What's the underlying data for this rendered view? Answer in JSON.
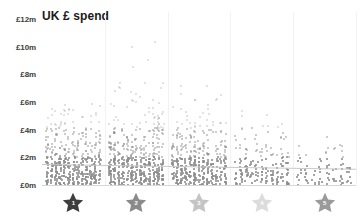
{
  "chart": {
    "title": "UK £ spend",
    "currency_symbol": "£"
  },
  "chart_data": {
    "type": "scatter",
    "title": "UK £ spend",
    "xlabel": "",
    "ylabel": "UK £ spend",
    "grid": "vertical-only",
    "legend": "none",
    "ylim": [
      0,
      12500000
    ],
    "ytick_labels": [
      "£12m",
      "£10m",
      "£8m",
      "£6m",
      "£4m",
      "£2m",
      "£0m"
    ],
    "ytick_values": [
      12000000,
      10000000,
      8000000,
      6000000,
      4000000,
      2000000,
      0
    ],
    "categories": [
      "1",
      "2",
      "3",
      "4",
      "5"
    ],
    "category_icon": "star-icon",
    "category_label_kind": "star-rating",
    "note": "Strip/jitter scatter of individual titles: dense mass below £2m, thinning sharply above £4m; trend line roughly flat near £1.3m across ratings.",
    "trend_line": {
      "visible": true,
      "start_value": 1500000,
      "end_value": 1150000
    },
    "series": [
      {
        "name": "1 star",
        "category": "1",
        "point_count": 470,
        "median": 900000,
        "max": 6200000,
        "density_profile": [
          0.95,
          0.72,
          0.44,
          0.24,
          0.12,
          0.06,
          0.03,
          0.015,
          0.008,
          0.004,
          0.002,
          0.001
        ]
      },
      {
        "name": "2 star",
        "category": "2",
        "point_count": 520,
        "median": 950000,
        "max": 11100000,
        "density_profile": [
          0.96,
          0.74,
          0.46,
          0.26,
          0.14,
          0.07,
          0.035,
          0.018,
          0.01,
          0.005,
          0.003,
          0.0015
        ]
      },
      {
        "name": "3 star",
        "category": "3",
        "point_count": 430,
        "median": 880000,
        "max": 7400000,
        "density_profile": [
          0.94,
          0.7,
          0.42,
          0.22,
          0.11,
          0.055,
          0.027,
          0.013,
          0.007,
          0.003,
          0.0015,
          0.0008
        ]
      },
      {
        "name": "4 star",
        "category": "4",
        "point_count": 190,
        "median": 700000,
        "max": 5600000,
        "density_profile": [
          0.8,
          0.46,
          0.24,
          0.12,
          0.06,
          0.03,
          0.015,
          0.008,
          0.004,
          0.002,
          0.001,
          0.0005
        ]
      },
      {
        "name": "5 star",
        "category": "5",
        "point_count": 95,
        "median": 560000,
        "max": 3900000,
        "density_profile": [
          0.62,
          0.32,
          0.15,
          0.07,
          0.035,
          0.018,
          0.009,
          0.004,
          0.002,
          0.001,
          0.0005,
          0.0002
        ]
      }
    ],
    "colors": {
      "dot": "#8e8e8e",
      "gridline": "#f2f2f2",
      "axis": "#d7d7d7",
      "trend": "#c9c9c9",
      "title": "#1b1b1b",
      "tick_label": "#3d3d3d"
    }
  }
}
